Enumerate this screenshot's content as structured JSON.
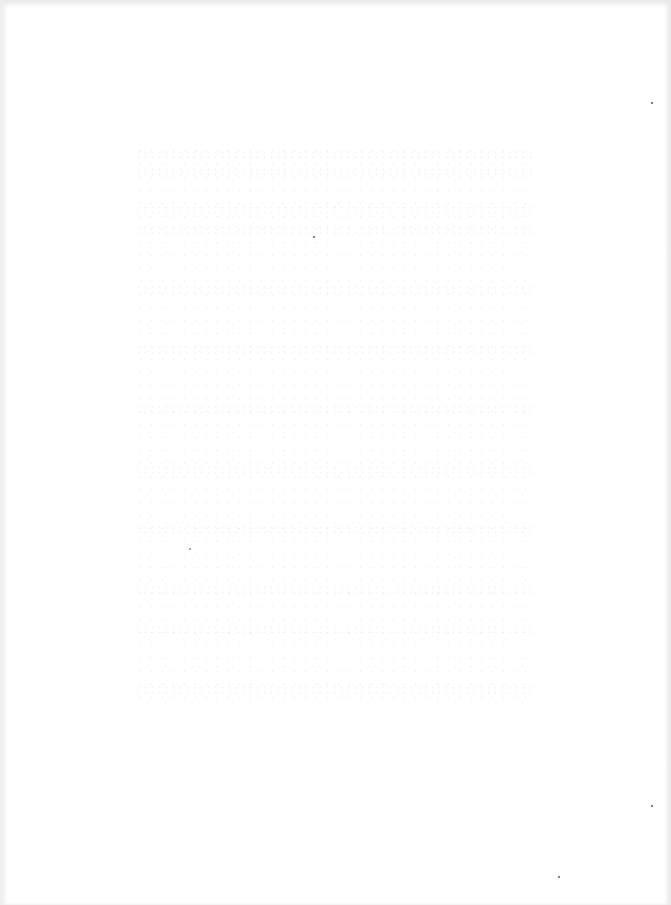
{
  "document": {
    "type": "scanned-page",
    "content": "",
    "background_color": "#ffffff"
  }
}
